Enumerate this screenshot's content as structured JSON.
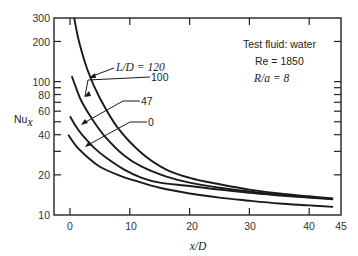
{
  "chart_data": {
    "type": "line",
    "title": "",
    "xlabel": "x/D",
    "ylabel": "Nu_x",
    "xlim": [
      -1.5,
      45
    ],
    "ylim": [
      10,
      300
    ],
    "yscale": "log",
    "grid": false,
    "x_ticks": [
      0,
      10,
      20,
      30,
      40,
      45
    ],
    "y_ticks": [
      10,
      20,
      40,
      60,
      80,
      100,
      200,
      300
    ],
    "annotations": [
      "Test fluid: water",
      "Re = 1850",
      "R/a = 8"
    ],
    "legend_labels": [
      "L/D = 120",
      "100",
      "47",
      "0"
    ],
    "series": [
      {
        "name": "L/D = 120",
        "x": [
          0.7,
          1.5,
          3,
          5,
          8,
          12,
          16,
          20,
          25,
          30,
          35,
          40,
          44
        ],
        "values": [
          300,
          200,
          120,
          75,
          45,
          29,
          22,
          19,
          17,
          15.5,
          14.5,
          13.8,
          13.3
        ]
      },
      {
        "name": "L/D = 100",
        "x": [
          0.3,
          1,
          2,
          4,
          6,
          9,
          12,
          16,
          20,
          25,
          30,
          35,
          40,
          44
        ],
        "values": [
          110,
          90,
          70,
          50,
          38,
          28,
          23,
          19.5,
          17.5,
          16,
          15,
          14.2,
          13.6,
          13.2
        ]
      },
      {
        "name": "L/D = 47",
        "x": [
          0,
          1,
          2,
          4,
          6,
          9,
          12,
          15,
          20,
          25,
          30,
          35,
          40,
          44
        ],
        "values": [
          55,
          46,
          40,
          32,
          27,
          22,
          19,
          17.5,
          16.5,
          15.5,
          14.7,
          14,
          13.5,
          13.1
        ]
      },
      {
        "name": "L/D = 0",
        "x": [
          -0.3,
          1,
          3,
          5,
          8,
          11,
          15,
          20,
          25,
          30,
          35,
          40,
          44
        ],
        "values": [
          40,
          33,
          27,
          23,
          20,
          18,
          16,
          14.5,
          13.5,
          12.8,
          12.2,
          11.8,
          11.5
        ]
      }
    ]
  },
  "labels": {
    "y_title": "Nu",
    "y_title_sub": "x",
    "x_title": "x/D",
    "ann1": "Test fluid: water",
    "ann2": "Re = 1850",
    "ann3": "R/a = 8",
    "lbl120": "L/D = 120",
    "lbl100": "100",
    "lbl47": "47",
    "lbl0": "0"
  },
  "ticks": {
    "y": [
      "300",
      "200",
      "100",
      "80",
      "60",
      "40",
      "20",
      "10"
    ],
    "x": [
      "0",
      "10",
      "20",
      "30",
      "40",
      "45"
    ]
  }
}
